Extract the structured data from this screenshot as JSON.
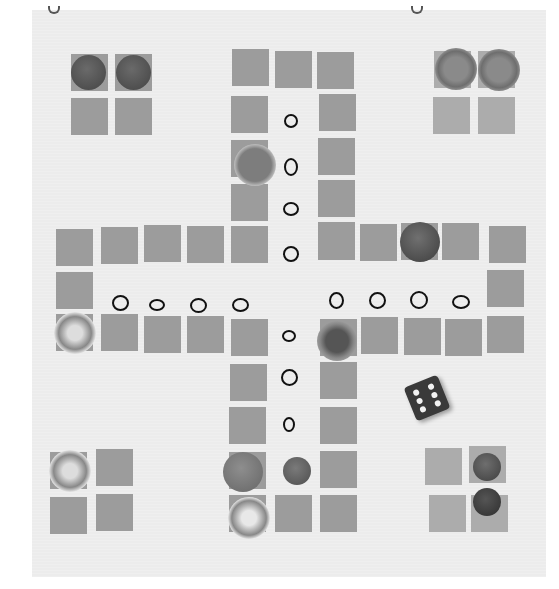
{
  "image": {
    "description": "Photograph of a hand-made ludo-style board game: grey paper squares arranged in a cross on a white sheet, hand-drawn circles marking home paths, sewing buttons used as playing pieces, and one die",
    "colors": {
      "paper": "#ececec",
      "square": "#9c9c9c",
      "circle_ink": "#111111",
      "die": "#3a3a3a"
    }
  },
  "board": {
    "layout": "cross",
    "home_bases": [
      {
        "corner": "top-left",
        "pieces": 2,
        "piece_style": "dark 2-hole buttons"
      },
      {
        "corner": "top-right",
        "pieces": 2,
        "piece_style": "light 4-hole buttons"
      },
      {
        "corner": "bottom-left",
        "pieces": 1,
        "piece_style": "shell 4-hole button"
      },
      {
        "corner": "bottom-right",
        "pieces": 2,
        "piece_style": "small dark 4-hole buttons"
      }
    ],
    "home_path_markers": {
      "top": 4,
      "left": 4,
      "right": 4,
      "bottom": 3
    }
  },
  "die": {
    "visible_face": 6
  }
}
